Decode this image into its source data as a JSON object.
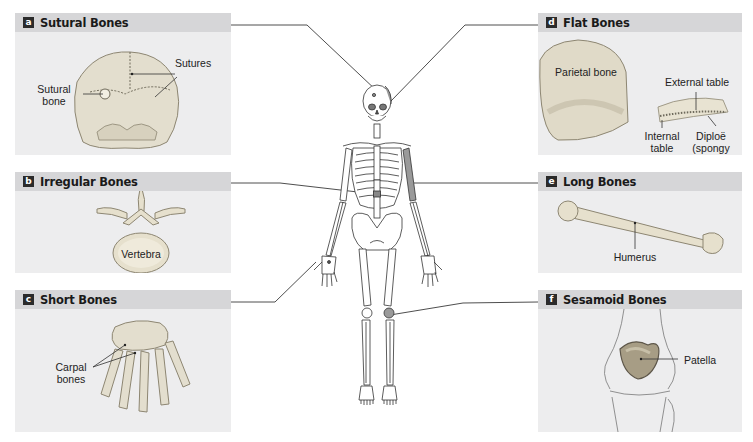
{
  "figure": {
    "type": "anatomical classification diagram"
  },
  "panels": {
    "a": {
      "badge": "a",
      "title": "Sutural Bones",
      "labels": {
        "sutural_bone": "Sutural bone",
        "sutures": "Sutures"
      }
    },
    "b": {
      "badge": "b",
      "title": "Irregular Bones",
      "labels": {
        "vertebra": "Vertebra"
      }
    },
    "c": {
      "badge": "c",
      "title": "Short Bones",
      "labels": {
        "carpal_bones": "Carpal bones"
      }
    },
    "d": {
      "badge": "d",
      "title": "Flat Bones",
      "labels": {
        "parietal_bone": "Parietal bone",
        "external_table": "External table",
        "internal_table": "Internal table",
        "diploe": "Diploë (spongy bone)"
      }
    },
    "e": {
      "badge": "e",
      "title": "Long Bones",
      "labels": {
        "humerus": "Humerus"
      }
    },
    "f": {
      "badge": "f",
      "title": "Sesamoid Bones",
      "labels": {
        "patella": "Patella"
      }
    }
  },
  "colors": {
    "panel_bg": "#ededee",
    "header_bg": "#d6d6d8",
    "badge_bg": "#2b2b2b",
    "bone": "#e9e4d0",
    "bone_shade": "#bdb59c",
    "highlight": "#9a9a9a",
    "leader_line": "#3a3a3a"
  }
}
